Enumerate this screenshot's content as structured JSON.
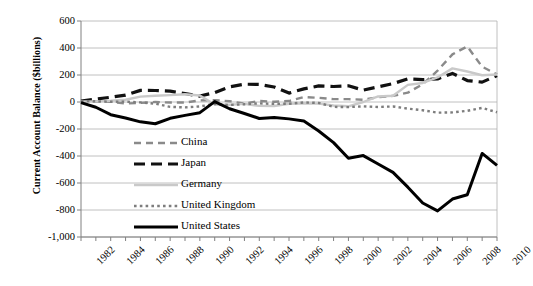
{
  "chart_data": {
    "type": "line",
    "title": "",
    "xlabel": "",
    "ylabel": "Current Account Balance ($billions)",
    "ylim": [
      -1000,
      600
    ],
    "ytick_values": [
      600,
      400,
      200,
      0,
      -200,
      -400,
      -600,
      -800,
      -1000
    ],
    "ytick_labels": [
      "600",
      "400",
      "200",
      "0",
      "-200",
      "-400",
      "-600",
      "-800",
      "-1,000"
    ],
    "grid": true,
    "grid_axis": "y",
    "legend_position": "center-left-inside",
    "x": [
      1982,
      1983,
      1984,
      1985,
      1986,
      1987,
      1988,
      1989,
      1990,
      1991,
      1992,
      1993,
      1994,
      1995,
      1996,
      1997,
      1998,
      1999,
      2000,
      2001,
      2002,
      2003,
      2004,
      2005,
      2006,
      2007,
      2008,
      2009,
      2010
    ],
    "xtick_labels": [
      "1982",
      "1984",
      "1986",
      "1988",
      "1990",
      "1992",
      "1994",
      "1996",
      "1998",
      "2000",
      "2002",
      "2004",
      "2006",
      "2008",
      "2010"
    ],
    "xlim": [
      1982,
      2010
    ],
    "series": [
      {
        "name": "China",
        "color": "#8a8a8a",
        "style": "dashed",
        "width": 2.4,
        "values": [
          5,
          4,
          2,
          -11,
          -7,
          0,
          -4,
          -4,
          12,
          13,
          6,
          -12,
          8,
          2,
          7,
          37,
          31,
          21,
          21,
          17,
          35,
          46,
          69,
          132,
          232,
          353,
          412,
          261,
          205
        ]
      },
      {
        "name": "Japan",
        "color": "#111111",
        "style": "dashed",
        "width": 3.2,
        "values": [
          7,
          21,
          35,
          51,
          86,
          85,
          80,
          63,
          44,
          69,
          112,
          132,
          130,
          111,
          66,
          97,
          119,
          115,
          120,
          88,
          112,
          136,
          172,
          166,
          171,
          212,
          159,
          147,
          196
        ]
      },
      {
        "name": "Germany",
        "color": "#c9c9c9",
        "style": "solid",
        "width": 2.4,
        "values": [
          5,
          5,
          9,
          17,
          40,
          46,
          51,
          57,
          48,
          -19,
          -20,
          -14,
          -29,
          -30,
          -13,
          -9,
          -12,
          -26,
          -32,
          0,
          41,
          46,
          127,
          141,
          182,
          249,
          226,
          198,
          204
        ]
      },
      {
        "name": "United Kingdom",
        "color": "#7d7d7d",
        "style": "dotted",
        "width": 2.4,
        "values": [
          7,
          5,
          2,
          3,
          -3,
          -12,
          -36,
          -40,
          -33,
          -14,
          -22,
          -17,
          -10,
          -14,
          -13,
          -3,
          -7,
          -36,
          -38,
          -32,
          -37,
          -33,
          -49,
          -61,
          -79,
          -77,
          -65,
          -44,
          -76
        ]
      },
      {
        "name": "United States",
        "color": "#000000",
        "style": "solid",
        "width": 3.0,
        "values": [
          -5,
          -39,
          -94,
          -118,
          -147,
          -161,
          -121,
          -99,
          -79,
          3,
          -50,
          -85,
          -122,
          -114,
          -125,
          -141,
          -215,
          -301,
          -417,
          -397,
          -459,
          -521,
          -631,
          -748,
          -807,
          -719,
          -687,
          -381,
          -470
        ]
      }
    ]
  }
}
